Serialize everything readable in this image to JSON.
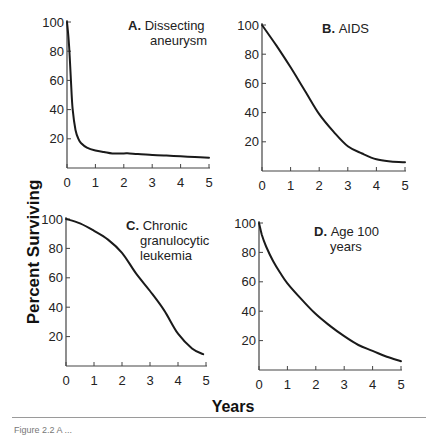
{
  "figure": {
    "ylabel": "Percent Surviving",
    "xlabel": "Years",
    "caption_partial": "Figure 2.2  A   ..."
  },
  "chart_data": [
    {
      "type": "line",
      "panel": "A",
      "title_letter": "A.",
      "title_lines": [
        "Dissecting",
        "aneurysm"
      ],
      "xlabel": "Years",
      "ylabel": "Percent Surviving",
      "xlim": [
        0,
        5
      ],
      "ylim": [
        0,
        100
      ],
      "xticks": [
        0,
        1,
        2,
        3,
        4,
        5
      ],
      "yticks": [
        20,
        40,
        60,
        80,
        100
      ],
      "grid": false,
      "x": [
        0,
        0.05,
        0.1,
        0.15,
        0.2,
        0.3,
        0.4,
        0.5,
        0.7,
        1.0,
        1.3,
        1.6,
        2.0,
        2.2,
        2.5,
        3.0,
        3.5,
        4.0,
        4.5,
        5.0
      ],
      "y": [
        100,
        90,
        75,
        55,
        40,
        26,
        20,
        17,
        14,
        12,
        11,
        10,
        10,
        10,
        9.5,
        9,
        8.5,
        8,
        7.5,
        7
      ]
    },
    {
      "type": "line",
      "panel": "B",
      "title_letter": "B.",
      "title_lines": [
        "AIDS"
      ],
      "xlabel": "Years",
      "ylabel": "Percent Surviving",
      "xlim": [
        0,
        5
      ],
      "ylim": [
        0,
        100
      ],
      "xticks": [
        0,
        1,
        2,
        3,
        4,
        5
      ],
      "yticks": [
        20,
        40,
        60,
        80,
        100
      ],
      "grid": false,
      "x": [
        0,
        0.5,
        1.0,
        1.5,
        2.0,
        2.5,
        3.0,
        3.5,
        4.0,
        4.5,
        5.0
      ],
      "y": [
        100,
        86,
        71,
        55,
        39,
        27,
        17,
        12,
        8,
        6.5,
        6
      ]
    },
    {
      "type": "line",
      "panel": "C",
      "title_letter": "C.",
      "title_lines": [
        "Chronic",
        "granulocytic",
        "leukemia"
      ],
      "xlabel": "Years",
      "ylabel": "Percent Surviving",
      "xlim": [
        0,
        5
      ],
      "ylim": [
        0,
        100
      ],
      "xticks": [
        0,
        1,
        2,
        3,
        4,
        5
      ],
      "yticks": [
        20,
        40,
        60,
        80,
        100
      ],
      "grid": false,
      "x": [
        0,
        0.5,
        1.0,
        1.5,
        2.0,
        2.5,
        3.0,
        3.5,
        4.0,
        4.5,
        4.9
      ],
      "y": [
        100,
        97,
        92,
        86,
        77,
        63,
        51,
        38,
        22,
        12,
        8
      ]
    },
    {
      "type": "line",
      "panel": "D",
      "title_letter": "D.",
      "title_lines": [
        "Age 100",
        "years"
      ],
      "xlabel": "Years",
      "ylabel": "Percent Surviving",
      "xlim": [
        0,
        5
      ],
      "ylim": [
        0,
        100
      ],
      "xticks": [
        0,
        1,
        2,
        3,
        4,
        5
      ],
      "yticks": [
        20,
        40,
        60,
        80,
        100
      ],
      "grid": false,
      "x": [
        0,
        0.1,
        0.25,
        0.5,
        0.75,
        1.0,
        1.5,
        2.0,
        2.5,
        3.0,
        3.5,
        4.0,
        4.5,
        5.0
      ],
      "y": [
        100,
        92,
        84,
        74,
        66,
        59,
        48,
        38,
        30,
        23,
        17,
        13,
        9,
        6
      ]
    }
  ],
  "layout": {
    "panels": [
      {
        "x0": 67,
        "x5": 209,
        "y100": 22,
        "y0": 168
      },
      {
        "x0": 262,
        "x5": 405,
        "y100": 25,
        "y0": 171
      },
      {
        "x0": 66,
        "x5": 206,
        "y100": 219,
        "y0": 366
      },
      {
        "x0": 259,
        "x5": 401,
        "y100": 223,
        "y0": 370
      }
    ],
    "titles": [
      {
        "x": 128,
        "y": 30,
        "anchor": "start",
        "indent": 22
      },
      {
        "x": 322,
        "y": 33,
        "anchor": "start",
        "indent": 0
      },
      {
        "x": 126,
        "y": 230,
        "anchor": "start",
        "indent": 14
      },
      {
        "x": 314,
        "y": 236,
        "anchor": "start",
        "indent": 16
      }
    ],
    "line_color": "#1a1a1a",
    "axis_color": "#444444"
  }
}
